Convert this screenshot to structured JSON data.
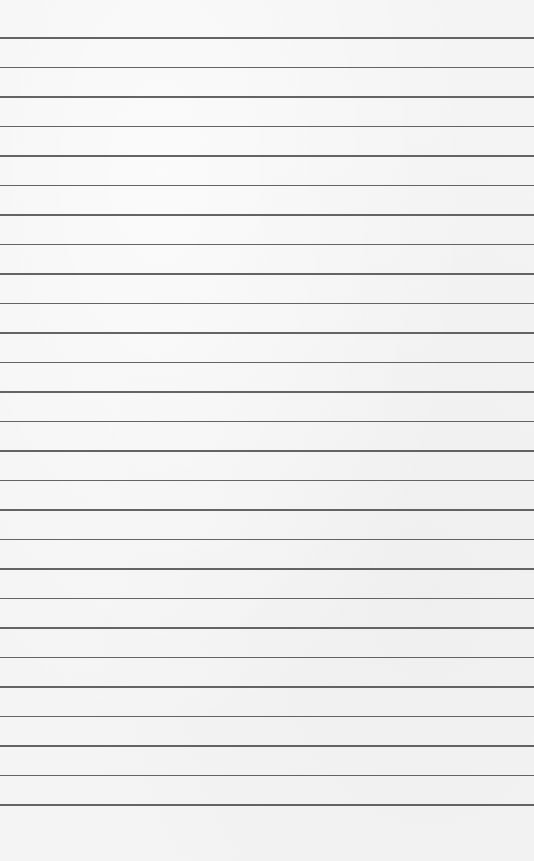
{
  "paper": {
    "background_color": "#f4f4f4",
    "line_color": "#4a4a4a",
    "first_line_y": 37,
    "line_spacing": 29.5,
    "line_count": 27
  }
}
